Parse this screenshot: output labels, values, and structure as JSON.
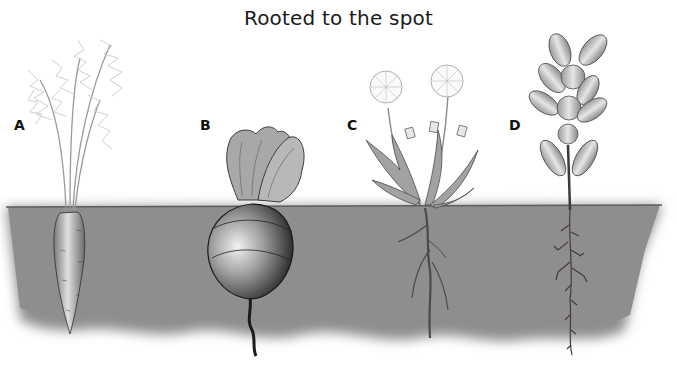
{
  "title": "Rooted to the spot",
  "plants": [
    {
      "label": "A",
      "name": "carrot",
      "root_type": "taproot (conical)"
    },
    {
      "label": "B",
      "name": "beet",
      "root_type": "taproot (swollen, round)"
    },
    {
      "label": "C",
      "name": "dandelion",
      "root_type": "branched taproot"
    },
    {
      "label": "D",
      "name": "leafy stem plant",
      "root_type": "fibrous branched root"
    }
  ],
  "colors": {
    "soil": "#8e8e8e",
    "soil_line": "#6a6a6a",
    "foliage": "#b5b5b5",
    "dark": "#3a3a3a"
  }
}
